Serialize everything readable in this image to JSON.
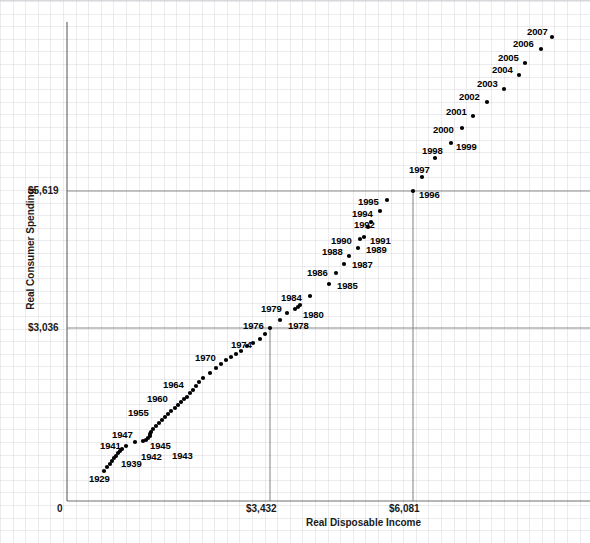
{
  "chart_data": {
    "type": "scatter",
    "title": "",
    "xlabel": "Real Disposable Income",
    "ylabel": "Real Consumer Spending",
    "grid": true,
    "legend": false,
    "x_ticks": [
      "0",
      "$3,432",
      "$6,081"
    ],
    "y_ticks": [
      "$3,036",
      "$5,619"
    ],
    "x_tick_values": [
      0,
      3432,
      6081
    ],
    "y_tick_values": [
      3036,
      5619
    ],
    "xlim": [
      0,
      7200
    ],
    "ylim": [
      0,
      8900
    ],
    "reference_lines": {
      "vertical_x": [
        3432,
        6081
      ],
      "horizontal_y": [
        3036,
        5619
      ]
    },
    "annotation_note": "Each point is labeled with its year; only selected years carry visible text labels.",
    "points": [
      {
        "label": "1929",
        "px": 104,
        "py": 470,
        "labeled": true,
        "lx": 89,
        "ly": 473
      },
      {
        "label": "",
        "px": 107,
        "py": 466,
        "labeled": false
      },
      {
        "label": "",
        "px": 110,
        "py": 463,
        "labeled": false
      },
      {
        "label": "",
        "px": 112,
        "py": 460,
        "labeled": false
      },
      {
        "label": "",
        "px": 114,
        "py": 457,
        "labeled": false
      },
      {
        "label": "",
        "px": 116,
        "py": 455,
        "labeled": false
      },
      {
        "label": "",
        "px": 118,
        "py": 452,
        "labeled": false
      },
      {
        "label": "",
        "px": 120,
        "py": 450,
        "labeled": false
      },
      {
        "label": "1939",
        "px": 122,
        "py": 448,
        "labeled": true,
        "lx": 121,
        "ly": 458
      },
      {
        "label": "",
        "px": 126,
        "py": 445,
        "labeled": false
      },
      {
        "label": "1941",
        "px": 135,
        "py": 441,
        "labeled": true,
        "lx": 100,
        "ly": 440
      },
      {
        "label": "1942",
        "px": 143,
        "py": 440,
        "labeled": true,
        "lx": 141,
        "ly": 451
      },
      {
        "label": "1943",
        "px": 146,
        "py": 439,
        "labeled": true,
        "lx": 172,
        "ly": 450
      },
      {
        "label": "",
        "px": 148,
        "py": 437,
        "labeled": false
      },
      {
        "label": "1945",
        "px": 150,
        "py": 435,
        "labeled": true,
        "lx": 150,
        "ly": 440
      },
      {
        "label": "",
        "px": 150,
        "py": 433,
        "labeled": false
      },
      {
        "label": "1947",
        "px": 151,
        "py": 431,
        "labeled": true,
        "lx": 112,
        "ly": 429
      },
      {
        "label": "",
        "px": 153,
        "py": 428,
        "labeled": false
      },
      {
        "label": "",
        "px": 156,
        "py": 425,
        "labeled": false
      },
      {
        "label": "",
        "px": 159,
        "py": 422,
        "labeled": false
      },
      {
        "label": "",
        "px": 162,
        "py": 419,
        "labeled": false
      },
      {
        "label": "",
        "px": 165,
        "py": 416,
        "labeled": false
      },
      {
        "label": "",
        "px": 168,
        "py": 413,
        "labeled": false
      },
      {
        "label": "1955",
        "px": 171,
        "py": 410,
        "labeled": true,
        "lx": 128,
        "ly": 407
      },
      {
        "label": "",
        "px": 175,
        "py": 407,
        "labeled": false
      },
      {
        "label": "",
        "px": 178,
        "py": 404,
        "labeled": false
      },
      {
        "label": "",
        "px": 181,
        "py": 401,
        "labeled": false
      },
      {
        "label": "",
        "px": 184,
        "py": 398,
        "labeled": false
      },
      {
        "label": "1960",
        "px": 187,
        "py": 396,
        "labeled": true,
        "lx": 147,
        "ly": 393
      },
      {
        "label": "",
        "px": 190,
        "py": 392,
        "labeled": false
      },
      {
        "label": "",
        "px": 193,
        "py": 389,
        "labeled": false
      },
      {
        "label": "",
        "px": 196,
        "py": 385,
        "labeled": false
      },
      {
        "label": "",
        "px": 199,
        "py": 381,
        "labeled": false
      },
      {
        "label": "1964",
        "px": 203,
        "py": 377,
        "labeled": true,
        "lx": 163,
        "ly": 379
      },
      {
        "label": "",
        "px": 210,
        "py": 372,
        "labeled": false
      },
      {
        "label": "",
        "px": 216,
        "py": 367,
        "labeled": false
      },
      {
        "label": "",
        "px": 221,
        "py": 363,
        "labeled": false
      },
      {
        "label": "",
        "px": 226,
        "py": 359,
        "labeled": false
      },
      {
        "label": "",
        "px": 231,
        "py": 356,
        "labeled": false
      },
      {
        "label": "1970",
        "px": 236,
        "py": 353,
        "labeled": true,
        "lx": 195,
        "ly": 352
      },
      {
        "label": "",
        "px": 241,
        "py": 350,
        "labeled": false
      },
      {
        "label": "",
        "px": 247,
        "py": 345,
        "labeled": false
      },
      {
        "label": "",
        "px": 253,
        "py": 342,
        "labeled": false
      },
      {
        "label": "1974",
        "px": 260,
        "py": 338,
        "labeled": true,
        "lx": 231,
        "ly": 339
      },
      {
        "label": "",
        "px": 265,
        "py": 333,
        "labeled": false
      },
      {
        "label": "1976",
        "px": 270,
        "py": 327,
        "labeled": true,
        "lx": 243,
        "ly": 320
      },
      {
        "label": "1978",
        "px": 280,
        "py": 319,
        "labeled": true,
        "lx": 288,
        "ly": 320
      },
      {
        "label": "1979",
        "px": 287,
        "py": 312,
        "labeled": true,
        "lx": 261,
        "ly": 303
      },
      {
        "label": "1980",
        "px": 295,
        "py": 308,
        "labeled": true,
        "lx": 303,
        "ly": 309
      },
      {
        "label": "",
        "px": 298,
        "py": 306,
        "labeled": false
      },
      {
        "label": "",
        "px": 300,
        "py": 304,
        "labeled": false
      },
      {
        "label": "1984",
        "px": 310,
        "py": 295,
        "labeled": true,
        "lx": 281,
        "ly": 292
      },
      {
        "label": "1985",
        "px": 329,
        "py": 283,
        "labeled": true,
        "lx": 337,
        "ly": 280
      },
      {
        "label": "1986",
        "px": 336,
        "py": 272,
        "labeled": true,
        "lx": 307,
        "ly": 267
      },
      {
        "label": "1987",
        "px": 344,
        "py": 263,
        "labeled": true,
        "lx": 352,
        "ly": 259
      },
      {
        "label": "1988",
        "px": 349,
        "py": 255,
        "labeled": true,
        "lx": 322,
        "ly": 246
      },
      {
        "label": "1989",
        "px": 358,
        "py": 247,
        "labeled": true,
        "lx": 366,
        "ly": 244
      },
      {
        "label": "1990",
        "px": 360,
        "py": 238,
        "labeled": true,
        "lx": 331,
        "ly": 235
      },
      {
        "label": "1991",
        "px": 364,
        "py": 236,
        "labeled": true,
        "lx": 370,
        "ly": 235
      },
      {
        "label": "1992",
        "px": 368,
        "py": 226,
        "labeled": true,
        "lx": 354,
        "ly": 219
      },
      {
        "label": "",
        "px": 371,
        "py": 221,
        "labeled": false
      },
      {
        "label": "1994",
        "px": 380,
        "py": 210,
        "labeled": true,
        "lx": 352,
        "ly": 208
      },
      {
        "label": "1995",
        "px": 387,
        "py": 199,
        "labeled": true,
        "lx": 358,
        "ly": 196
      },
      {
        "label": "1996",
        "px": 413,
        "py": 190,
        "labeled": true,
        "lx": 419,
        "ly": 189
      },
      {
        "label": "1997",
        "px": 422,
        "py": 176,
        "labeled": true,
        "lx": 409,
        "ly": 164
      },
      {
        "label": "1998",
        "px": 435,
        "py": 157,
        "labeled": true,
        "lx": 422,
        "ly": 145
      },
      {
        "label": "1999",
        "px": 451,
        "py": 142,
        "labeled": true,
        "lx": 456,
        "ly": 141
      },
      {
        "label": "2000",
        "px": 462,
        "py": 127,
        "labeled": true,
        "lx": 433,
        "ly": 124
      },
      {
        "label": "2001",
        "px": 473,
        "py": 115,
        "labeled": true,
        "lx": 446,
        "ly": 106
      },
      {
        "label": "2002",
        "px": 487,
        "py": 101,
        "labeled": true,
        "lx": 459,
        "ly": 91
      },
      {
        "label": "2003",
        "px": 504,
        "py": 88,
        "labeled": true,
        "lx": 477,
        "ly": 78
      },
      {
        "label": "2004",
        "px": 519,
        "py": 74,
        "labeled": true,
        "lx": 492,
        "ly": 64
      },
      {
        "label": "2005",
        "px": 525,
        "py": 62,
        "labeled": true,
        "lx": 498,
        "ly": 52
      },
      {
        "label": "2006",
        "px": 541,
        "py": 48,
        "labeled": true,
        "lx": 513,
        "ly": 38
      },
      {
        "label": "2007",
        "px": 552,
        "py": 36,
        "labeled": true,
        "lx": 527,
        "ly": 26
      }
    ]
  }
}
